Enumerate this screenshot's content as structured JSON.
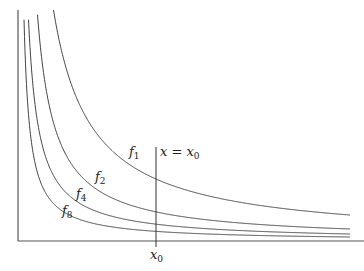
{
  "diagram": {
    "title": "",
    "axes": {
      "origin": [
        18,
        241
      ],
      "y_top": 10,
      "x_right": 364,
      "color": "#555555"
    },
    "vertical_line": {
      "x": 156,
      "y_top": 147,
      "y_bottom": 247,
      "label_var": "x",
      "label_eq": " = ",
      "label_rhs": "x",
      "label_rhs_sub": "0"
    },
    "x_tick_label": {
      "var": "x",
      "sub": "0"
    },
    "curves": [
      {
        "name": "f",
        "sub": "1",
        "A": 8684,
        "B": 15.9,
        "label_pos": [
          129,
          156
        ]
      },
      {
        "name": "f",
        "sub": "2",
        "A": 3960,
        "B": 20,
        "label_pos": [
          95,
          181
        ]
      },
      {
        "name": "f",
        "sub": "4",
        "A": 2324,
        "B": 18,
        "label_pos": [
          76,
          198
        ]
      },
      {
        "name": "f",
        "sub": "8",
        "A": 1328,
        "B": 18,
        "label_pos": [
          62,
          215
        ]
      }
    ],
    "curve_x_end": 350,
    "curve_color": "#444444"
  }
}
